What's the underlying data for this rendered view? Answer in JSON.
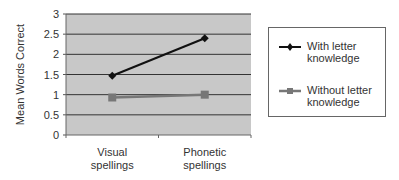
{
  "chart_data": {
    "type": "line",
    "title": "",
    "xlabel": "",
    "ylabel": "Mean Words Correct",
    "categories": [
      "Visual spellings",
      "Phonetic spellings"
    ],
    "category_lines": [
      [
        "Visual",
        "spellings"
      ],
      [
        "Phonetic",
        "spellings"
      ]
    ],
    "series": [
      {
        "name": "With letter knowledge",
        "name_lines": [
          "With letter",
          "knowledge"
        ],
        "values": [
          1.47,
          2.4
        ],
        "color": "#111111",
        "marker": "diamond"
      },
      {
        "name": "Without letter knowledge",
        "name_lines": [
          "Without letter",
          "knowledge"
        ],
        "values": [
          0.93,
          1.0
        ],
        "color": "#777777",
        "marker": "square"
      }
    ],
    "ylim": [
      0,
      3
    ],
    "yticks": [
      "0",
      "0.5",
      "1",
      "1.5",
      "2",
      "2.5",
      "3"
    ],
    "grid": true,
    "plot_background": "#c8c8c8",
    "legend_position": "right"
  }
}
